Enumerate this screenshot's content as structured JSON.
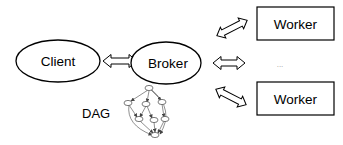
{
  "diagram": {
    "nodes": {
      "client": {
        "label": "Client",
        "shape": "ellipse"
      },
      "broker": {
        "label": "Broker",
        "shape": "ellipse"
      },
      "worker_top": {
        "label": "Worker",
        "shape": "rectangle"
      },
      "worker_bottom": {
        "label": "Worker",
        "shape": "rectangle"
      },
      "ellipsis": {
        "label": "..."
      }
    },
    "dag": {
      "label": "DAG",
      "node_count": 7
    },
    "edges": [
      {
        "from": "client",
        "to": "broker",
        "type": "bidirectional-hollow-arrow"
      },
      {
        "from": "broker",
        "to": "worker_top",
        "type": "bidirectional-hollow-arrow"
      },
      {
        "from": "broker",
        "to": "ellipsis",
        "type": "bidirectional-hollow-arrow"
      },
      {
        "from": "broker",
        "to": "worker_bottom",
        "type": "bidirectional-hollow-arrow"
      }
    ],
    "colors": {
      "stroke": "#000000",
      "background": "#ffffff",
      "dag_stroke": "#444444"
    }
  }
}
